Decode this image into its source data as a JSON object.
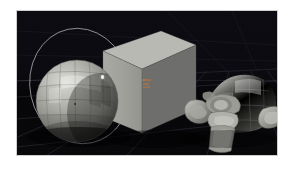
{
  "app": {
    "kind": "3d-viewport-render",
    "title": "3D Viewport Render"
  },
  "viewport": {
    "name": "3d-viewport",
    "background_color": "#08080c",
    "frame_border_color": "#cfcfcf",
    "page_background": "#ffffff",
    "horizon_color": "#96969a",
    "grid": {
      "visible": true,
      "color": "#2a2a33",
      "style": "perspective-floor-grid"
    }
  },
  "scene": {
    "label": "Default scene",
    "objects": [
      {
        "id": "sphere",
        "name": "UV Sphere",
        "shape": "sphere",
        "shading": "flat-faceted",
        "base_color": "#9a9a96",
        "highlight_color": "#d6d6d2",
        "shadow_color": "#4a4a48",
        "selected": true,
        "has_specular_highlight": true,
        "position": {
          "x": 18,
          "y": 48,
          "width": 84,
          "height": 84
        }
      },
      {
        "id": "cube",
        "name": "Cube",
        "shape": "cube",
        "shading": "flat",
        "top_face_color": "#b9b9b5",
        "front_face_color": "#a2a29e",
        "right_face_color": "#6f6f6d",
        "selected": false,
        "position": {
          "x": 84,
          "y": 18,
          "width": 96,
          "height": 105
        }
      },
      {
        "id": "monkey",
        "name": "Suzanne",
        "shape": "monkey-head",
        "shading": "flat-faceted",
        "base_color": "#a5a5a0",
        "highlight_color": "#d0d0cb",
        "shadow_color": "#55554f",
        "selected": false,
        "position": {
          "x": 160,
          "y": 54,
          "width": 108,
          "height": 90
        }
      }
    ]
  },
  "overlays": {
    "selection_ring": {
      "name": "selection-ring",
      "color": "#a8a8ad",
      "visible": true
    },
    "transform_gizmo": {
      "name": "transform-gizmo",
      "color": "#c8783c",
      "visible": true
    },
    "object_origin": {
      "name": "object-origin",
      "color": "#2b2b2b",
      "visible": true
    },
    "specular_highlight": {
      "name": "specular-highlight",
      "color": "#f4f4f0",
      "visible": true
    }
  }
}
